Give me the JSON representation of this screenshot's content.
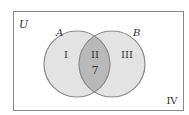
{
  "diagram": {
    "universe_label": "U",
    "sets": [
      {
        "label": "A",
        "region_label": "I"
      },
      {
        "label": "B",
        "region_label": "III"
      }
    ],
    "intersection": {
      "region_label": "II",
      "value": "7"
    },
    "outside_region_label": "IV",
    "colors": {
      "border": "#888888",
      "circle_fill": "#e3e3e3",
      "circle_stroke": "#8a8a8a",
      "intersection_fill": "#b9b9b9",
      "text": "#333333"
    }
  }
}
